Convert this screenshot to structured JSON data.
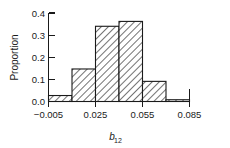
{
  "chart_data": {
    "type": "bar",
    "title": "",
    "subtitle": "",
    "xlabel": "b",
    "xlabel_sub": "12",
    "ylabel": "Proportion",
    "bin_width": 0.015,
    "bin_edges": [
      -0.005,
      0.01,
      0.025,
      0.04,
      0.055,
      0.07,
      0.085
    ],
    "categories": [
      "-0.005 to 0.010",
      "0.010 to 0.025",
      "0.025 to 0.040",
      "0.040 to 0.055",
      "0.055 to 0.070",
      "0.070 to 0.085"
    ],
    "values": [
      0.027,
      0.147,
      0.34,
      0.362,
      0.091,
      0.008
    ],
    "x": [
      -0.005,
      0.01,
      0.025,
      0.04,
      0.055,
      0.07
    ],
    "xlim": [
      -0.005,
      0.085
    ],
    "ylim": [
      0.0,
      0.4
    ],
    "x_ticks": [
      -0.005,
      0.025,
      0.055,
      0.085
    ],
    "x_tick_labels": [
      "−0.005",
      "0.025",
      "0.055",
      "0.085"
    ],
    "y_ticks": [
      0.0,
      0.1,
      0.2,
      0.3,
      0.4
    ],
    "y_tick_labels": [
      "0.0",
      "0.1",
      "0.2",
      "0.3",
      "0.4"
    ],
    "grid": false,
    "legend": null,
    "legend_position": "none",
    "fill_pattern": "diagonal-hatch",
    "colors": {
      "axis": "#1a1a1a",
      "bar_outline": "#1a1a1a",
      "bar_fill": "#ffffff",
      "hatch": "#555555",
      "background": "#ffffff"
    }
  }
}
